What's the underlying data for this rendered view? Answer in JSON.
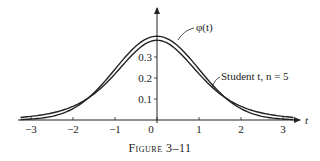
{
  "figure": {
    "caption_word": "Figure",
    "caption_number": "3–11"
  },
  "axes": {
    "x_label": "t",
    "y_label": "",
    "x_ticks": [
      "−3",
      "−2",
      "−1",
      "0",
      "1",
      "2",
      "3"
    ],
    "y_ticks": [
      "0.1",
      "0.2",
      "0.3"
    ]
  },
  "annotations": {
    "normal_label": "φ(t)",
    "student_label": "Student t, n = 5"
  },
  "chart_data": {
    "type": "line",
    "title": "Figure 3–11",
    "xlabel": "t",
    "ylabel": "",
    "xlim": [
      -3.2,
      3.3
    ],
    "ylim": [
      0,
      0.45
    ],
    "grid": false,
    "legend": "inline annotations",
    "x_ticks": [
      -3,
      -2,
      -1,
      0,
      1,
      2,
      3
    ],
    "y_ticks": [
      0.1,
      0.2,
      0.3
    ],
    "x": [
      -3,
      -2.5,
      -2,
      -1.5,
      -1,
      -0.5,
      0,
      0.5,
      1,
      1.5,
      2,
      2.5,
      3
    ],
    "series": [
      {
        "name": "φ(t) (standard normal)",
        "values": [
          0.0044,
          0.0175,
          0.054,
          0.1295,
          0.242,
          0.3521,
          0.3989,
          0.3521,
          0.242,
          0.1295,
          0.054,
          0.0175,
          0.0044
        ]
      },
      {
        "name": "Student t, n = 5",
        "values": [
          0.0173,
          0.0338,
          0.0651,
          0.1245,
          0.2197,
          0.3279,
          0.3796,
          0.3279,
          0.2197,
          0.1245,
          0.0651,
          0.0338,
          0.0173
        ]
      }
    ]
  }
}
